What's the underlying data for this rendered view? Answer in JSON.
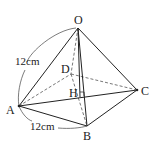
{
  "diagram": {
    "type": "square-pyramid",
    "vertices": {
      "O": {
        "label": "O",
        "x": 78,
        "y": 28
      },
      "A": {
        "label": "A",
        "x": 19,
        "y": 106
      },
      "B": {
        "label": "B",
        "x": 87,
        "y": 126
      },
      "C": {
        "label": "C",
        "x": 137,
        "y": 90
      },
      "D": {
        "label": "D",
        "x": 71,
        "y": 74
      },
      "H": {
        "label": "H",
        "x": 80,
        "y": 97
      }
    },
    "measurements": {
      "OA": "12cm",
      "AB": "12cm"
    },
    "colors": {
      "line": "#222222",
      "hidden": "#666666"
    }
  }
}
